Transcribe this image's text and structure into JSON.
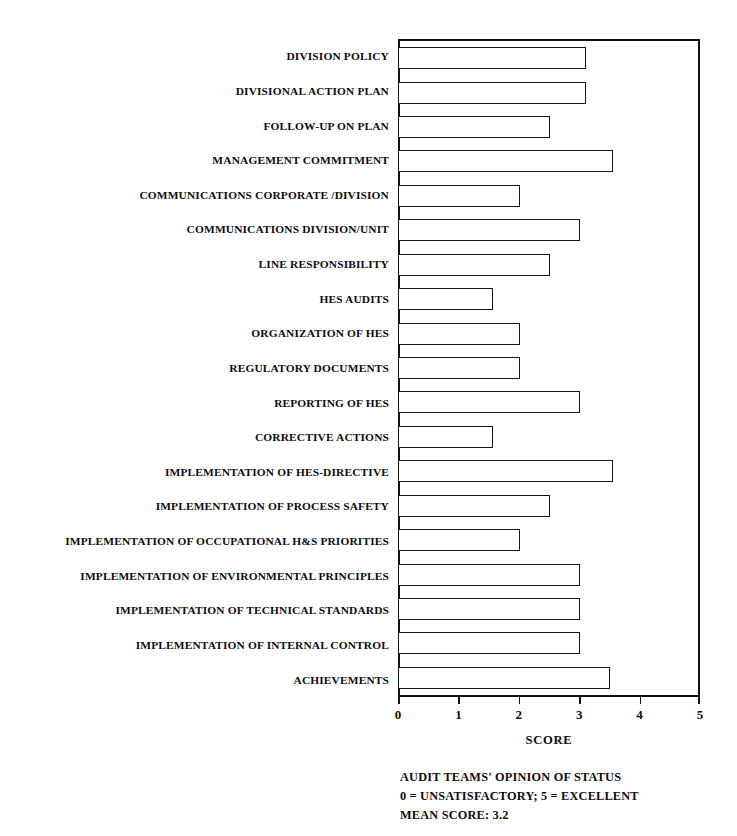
{
  "chart_data": {
    "type": "bar",
    "orientation": "horizontal",
    "title": "",
    "xlabel": "SCORE",
    "ylabel": "",
    "xlim": [
      0,
      5
    ],
    "xticks": [
      0,
      1,
      2,
      3,
      4,
      5
    ],
    "xtick_labels": [
      "0",
      "1",
      "2",
      "3",
      "4",
      "5"
    ],
    "grid": false,
    "legend": null,
    "categories": [
      "DIVISION POLICY",
      "DIVISIONAL ACTION PLAN",
      "FOLLOW-UP ON PLAN",
      "MANAGEMENT COMMITMENT",
      "COMMUNICATIONS CORPORATE /DIVISION",
      "COMMUNICATIONS DIVISION/UNIT",
      "LINE RESPONSIBILITY",
      "HES AUDITS",
      "ORGANIZATION OF HES",
      "REGULATORY DOCUMENTS",
      "REPORTING OF HES",
      "CORRECTIVE ACTIONS",
      "IMPLEMENTATION OF HES-DIRECTIVE",
      "IMPLEMENTATION OF PROCESS SAFETY",
      "IMPLEMENTATION OF OCCUPATIONAL H&S PRIORITIES",
      "IMPLEMENTATION OF ENVIRONMENTAL PRINCIPLES",
      "IMPLEMENTATION OF TECHNICAL STANDARDS",
      "IMPLEMENTATION OF INTERNAL CONTROL",
      "ACHIEVEMENTS"
    ],
    "values": [
      3.1,
      3.1,
      2.5,
      3.55,
      2.0,
      3.0,
      2.5,
      1.55,
      2.0,
      2.0,
      3.0,
      1.55,
      3.55,
      2.5,
      2.0,
      3.0,
      3.0,
      3.0,
      3.5
    ]
  },
  "caption": {
    "lines": [
      "AUDIT TEAMS' OPINION OF STATUS",
      "0 = UNSATISFACTORY;  5 = EXCELLENT",
      "MEAN SCORE:  3.2"
    ],
    "mean_score": "3.2"
  },
  "colors": {
    "bar_fill": "#ffffff",
    "bar_stroke": "#141414",
    "axis": "#111111",
    "text": "#0d0d0d",
    "background": "#ffffff"
  }
}
